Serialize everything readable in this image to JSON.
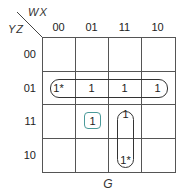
{
  "kmap": {
    "column_var": "WX",
    "row_var": "YZ",
    "columns": [
      "00",
      "01",
      "11",
      "10"
    ],
    "rows": [
      "00",
      "01",
      "11",
      "10"
    ],
    "cells": [
      [
        "",
        "",
        "",
        ""
      ],
      [
        "1*",
        "1",
        "1",
        "1"
      ],
      [
        "",
        "1",
        "1",
        ""
      ],
      [
        "",
        "",
        "1*",
        ""
      ]
    ],
    "function_name": "G",
    "groups": [
      {
        "name": "row-01-quad",
        "cells": [
          [
            1,
            0
          ],
          [
            1,
            1
          ],
          [
            1,
            2
          ],
          [
            1,
            3
          ]
        ],
        "color": "#333333"
      },
      {
        "name": "col-11-pair",
        "cells": [
          [
            2,
            2
          ],
          [
            3,
            2
          ]
        ],
        "color": "#333333"
      },
      {
        "name": "single-1101",
        "cells": [
          [
            2,
            1
          ]
        ],
        "color": "#4a9a9a"
      }
    ]
  }
}
